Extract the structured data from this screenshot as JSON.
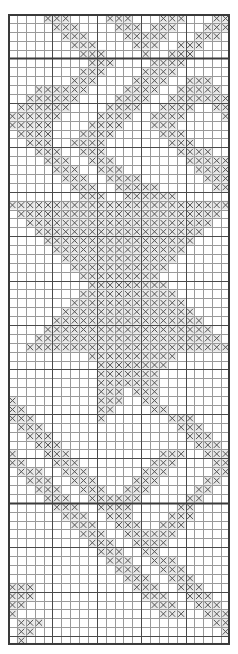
{
  "document": {
    "title": "Filet Pattern Chart",
    "type": "stitch-chart-grid"
  },
  "chart": {
    "kind": "grid-pattern-chart",
    "columns": 25,
    "rows": 71,
    "cell_width_px": 8.88,
    "cell_height_px": 8.887,
    "origin_x_px": 8,
    "origin_y_px": 14,
    "symbol": "×",
    "symbol_name": "x-mark",
    "colors": {
      "background": "#ffffff",
      "minor_gridline": "#9a9a9a",
      "major_gridline": "#4a4a4a",
      "border": "#3a3a3a",
      "section_divider": "#3a3a3a",
      "symbol": "#555555",
      "filled_cell_background": "#e8e8e8"
    },
    "major_gridline_every": 5,
    "section_divider_rows": [
      5,
      55
    ],
    "legend": {
      "filled": "×  = filled stitch",
      "empty": "     = open mesh"
    },
    "filled_cells": [
      [
        0,
        [
          4,
          5,
          6,
          11,
          12,
          13,
          17,
          18,
          19,
          23,
          24
        ]
      ],
      [
        1,
        [
          5,
          6,
          7,
          12,
          13,
          14,
          16,
          17,
          18,
          22,
          23,
          24
        ]
      ],
      [
        2,
        [
          6,
          7,
          8,
          13,
          14,
          15,
          16,
          17,
          21,
          22,
          23
        ]
      ],
      [
        3,
        [
          7,
          8,
          9,
          14,
          15,
          16,
          19,
          20,
          21
        ]
      ],
      [
        4,
        [
          8,
          9,
          10,
          15,
          18,
          19,
          20
        ]
      ],
      [
        5,
        [
          9,
          10,
          11,
          16,
          17,
          18,
          19
        ]
      ],
      [
        6,
        [
          8,
          9,
          10,
          15,
          16,
          17,
          18
        ]
      ],
      [
        7,
        [
          7,
          8,
          9,
          14,
          15,
          16,
          17,
          20,
          21,
          22
        ]
      ],
      [
        8,
        [
          3,
          4,
          5,
          6,
          7,
          8,
          13,
          14,
          15,
          16,
          19,
          20,
          21,
          22,
          23
        ]
      ],
      [
        9,
        [
          2,
          3,
          4,
          5,
          6,
          7,
          12,
          13,
          14,
          15,
          18,
          19,
          20,
          21,
          22,
          23,
          24
        ]
      ],
      [
        10,
        [
          1,
          2,
          3,
          4,
          5,
          6,
          11,
          12,
          13,
          14,
          17,
          18,
          19,
          20,
          23,
          24
        ]
      ],
      [
        11,
        [
          0,
          1,
          2,
          3,
          4,
          5,
          10,
          11,
          12,
          13,
          16,
          17,
          18,
          19,
          24
        ]
      ],
      [
        12,
        [
          0,
          1,
          2,
          3,
          4,
          9,
          10,
          11,
          12,
          16,
          17,
          18
        ]
      ],
      [
        13,
        [
          1,
          2,
          3,
          4,
          8,
          9,
          10,
          11,
          17,
          18,
          19
        ]
      ],
      [
        14,
        [
          2,
          3,
          4,
          7,
          8,
          9,
          10,
          18,
          19,
          20
        ]
      ],
      [
        15,
        [
          3,
          4,
          5,
          8,
          9,
          10,
          19,
          20,
          21,
          22
        ]
      ],
      [
        16,
        [
          4,
          5,
          6,
          9,
          10,
          11,
          20,
          21,
          22,
          23,
          24
        ]
      ],
      [
        17,
        [
          5,
          6,
          7,
          10,
          11,
          12,
          21,
          22,
          23,
          24
        ]
      ],
      [
        18,
        [
          6,
          7,
          8,
          11,
          12,
          13,
          14,
          22,
          23,
          24
        ]
      ],
      [
        19,
        [
          7,
          8,
          9,
          12,
          13,
          14,
          15,
          16,
          23,
          24
        ]
      ],
      [
        20,
        [
          8,
          9,
          10,
          13,
          14,
          15,
          16,
          17,
          18
        ]
      ],
      [
        21,
        [
          0,
          1,
          2,
          3,
          4,
          5,
          6,
          7,
          8,
          9,
          10,
          11,
          12,
          13,
          14,
          15,
          16,
          17,
          18,
          19,
          20,
          21,
          22,
          23,
          24
        ]
      ],
      [
        22,
        [
          1,
          2,
          3,
          4,
          5,
          6,
          7,
          8,
          9,
          10,
          11,
          12,
          13,
          14,
          15,
          16,
          17,
          18,
          19,
          20,
          21,
          22,
          23
        ]
      ],
      [
        23,
        [
          2,
          3,
          4,
          5,
          6,
          7,
          8,
          9,
          10,
          11,
          12,
          13,
          14,
          15,
          16,
          17,
          18,
          19,
          20,
          21,
          22
        ]
      ],
      [
        24,
        [
          3,
          4,
          5,
          6,
          7,
          8,
          9,
          10,
          11,
          12,
          13,
          14,
          15,
          16,
          17,
          18,
          19,
          20,
          21
        ]
      ],
      [
        25,
        [
          4,
          5,
          6,
          7,
          8,
          9,
          10,
          11,
          12,
          13,
          14,
          15,
          16,
          17,
          18,
          19,
          20
        ]
      ],
      [
        26,
        [
          5,
          6,
          7,
          8,
          9,
          10,
          11,
          12,
          13,
          14,
          15,
          16,
          17,
          18,
          19
        ]
      ],
      [
        27,
        [
          6,
          7,
          8,
          9,
          10,
          11,
          12,
          13,
          14,
          15,
          16,
          17,
          18
        ]
      ],
      [
        28,
        [
          7,
          8,
          9,
          10,
          11,
          12,
          13,
          14,
          15,
          16,
          17
        ]
      ],
      [
        29,
        [
          8,
          9,
          10,
          11,
          12,
          13,
          14,
          15,
          16
        ]
      ],
      [
        30,
        [
          9,
          10,
          11,
          12,
          13,
          14,
          15,
          16,
          17
        ]
      ],
      [
        31,
        [
          8,
          9,
          10,
          11,
          12,
          13,
          14,
          15,
          16,
          17,
          18
        ]
      ],
      [
        32,
        [
          7,
          8,
          9,
          10,
          11,
          12,
          13,
          14,
          15,
          16,
          17,
          18,
          19
        ]
      ],
      [
        33,
        [
          6,
          7,
          8,
          9,
          10,
          11,
          12,
          13,
          14,
          15,
          16,
          17,
          18,
          19,
          20
        ]
      ],
      [
        34,
        [
          5,
          6,
          7,
          8,
          9,
          10,
          11,
          12,
          13,
          14,
          15,
          16,
          17,
          18,
          19,
          20,
          21
        ]
      ],
      [
        35,
        [
          4,
          5,
          6,
          7,
          8,
          9,
          10,
          11,
          12,
          13,
          14,
          15,
          16,
          17,
          18,
          19,
          20,
          21,
          22
        ]
      ],
      [
        36,
        [
          3,
          4,
          5,
          6,
          7,
          8,
          9,
          10,
          11,
          12,
          13,
          14,
          15,
          16,
          17,
          18,
          19,
          20,
          21,
          22,
          23
        ]
      ],
      [
        37,
        [
          2,
          3,
          4,
          5,
          6,
          7,
          8,
          9,
          10,
          11,
          12,
          13,
          14,
          15,
          16,
          17,
          18,
          19,
          20,
          21,
          22,
          23,
          24
        ]
      ],
      [
        38,
        [
          9,
          10,
          11,
          12,
          13,
          14,
          15,
          16,
          17,
          18
        ]
      ],
      [
        39,
        [
          10,
          11,
          12,
          13,
          14,
          15,
          16,
          17
        ]
      ],
      [
        40,
        [
          10,
          11,
          12,
          13,
          14,
          15,
          16
        ]
      ],
      [
        41,
        [
          10,
          11,
          12,
          13,
          14,
          15,
          16
        ]
      ],
      [
        42,
        [
          10,
          11,
          12,
          14,
          15,
          16
        ]
      ],
      [
        43,
        [
          0,
          10,
          11,
          12,
          15,
          16
        ]
      ],
      [
        44,
        [
          0,
          1,
          10,
          11,
          16,
          17
        ]
      ],
      [
        45,
        [
          0,
          1,
          2,
          10,
          18,
          19,
          20
        ]
      ],
      [
        46,
        [
          1,
          2,
          3,
          19,
          20,
          21
        ]
      ],
      [
        47,
        [
          2,
          3,
          4,
          20,
          21,
          22
        ]
      ],
      [
        48,
        [
          3,
          4,
          5,
          21,
          22,
          23
        ]
      ],
      [
        49,
        [
          0,
          4,
          5,
          6,
          17,
          18,
          19,
          22,
          23,
          24
        ]
      ],
      [
        50,
        [
          0,
          1,
          5,
          6,
          7,
          16,
          17,
          18,
          23,
          24
        ]
      ],
      [
        51,
        [
          1,
          2,
          3,
          6,
          7,
          8,
          15,
          16,
          17,
          23,
          24
        ]
      ],
      [
        52,
        [
          2,
          3,
          4,
          7,
          8,
          9,
          14,
          15,
          16,
          22,
          23
        ]
      ],
      [
        53,
        [
          3,
          4,
          5,
          8,
          9,
          10,
          13,
          14,
          15,
          21,
          22
        ]
      ],
      [
        54,
        [
          4,
          5,
          6,
          9,
          10,
          11,
          12,
          13,
          14,
          20,
          21
        ]
      ],
      [
        55,
        [
          5,
          6,
          7,
          10,
          11,
          12,
          13,
          19,
          20
        ]
      ],
      [
        56,
        [
          6,
          7,
          8,
          11,
          12,
          13,
          18,
          19,
          20
        ]
      ],
      [
        57,
        [
          7,
          8,
          9,
          12,
          13,
          14,
          17,
          18,
          19
        ]
      ],
      [
        58,
        [
          8,
          9,
          10,
          13,
          14,
          15,
          16,
          17,
          18
        ]
      ],
      [
        59,
        [
          9,
          10,
          11,
          14,
          15,
          16,
          17
        ]
      ],
      [
        60,
        [
          10,
          11,
          12,
          15,
          16
        ]
      ],
      [
        61,
        [
          11,
          12,
          13,
          16,
          17,
          18
        ]
      ],
      [
        62,
        [
          12,
          13,
          14,
          17,
          18,
          19
        ]
      ],
      [
        63,
        [
          13,
          14,
          15,
          18,
          19,
          20
        ]
      ],
      [
        64,
        [
          0,
          1,
          2,
          14,
          15,
          16,
          19,
          20,
          21
        ]
      ],
      [
        65,
        [
          0,
          1,
          2,
          15,
          16,
          17,
          20,
          21,
          22
        ]
      ],
      [
        66,
        [
          0,
          1,
          16,
          17,
          18,
          21,
          22,
          23
        ]
      ],
      [
        67,
        [
          0,
          17,
          18,
          19,
          22,
          23,
          24
        ]
      ],
      [
        68,
        [
          1,
          2,
          3,
          23,
          24
        ]
      ],
      [
        69,
        [
          1,
          2,
          24
        ]
      ],
      [
        70,
        [
          1
        ]
      ]
    ]
  }
}
